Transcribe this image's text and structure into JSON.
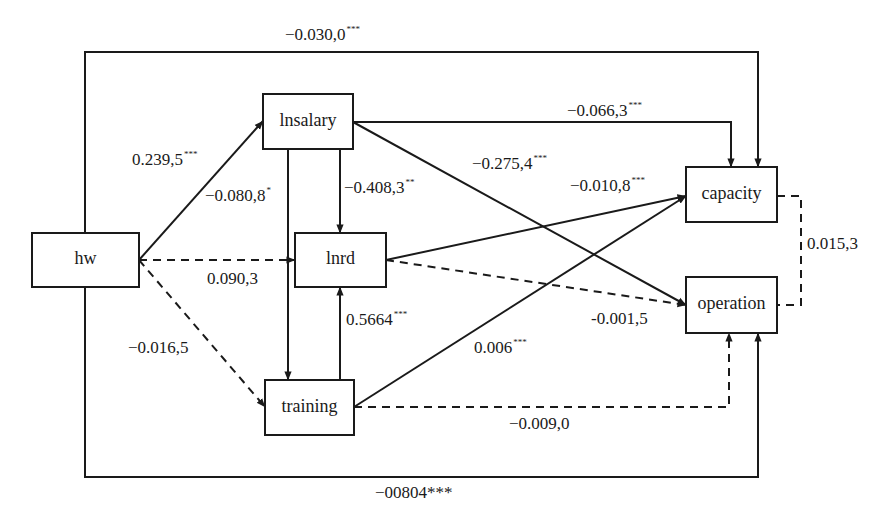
{
  "figure": {
    "type": "path-diagram",
    "nodes": [
      {
        "id": "hw",
        "label": "hw"
      },
      {
        "id": "lnsalary",
        "label": "lnsalary"
      },
      {
        "id": "lnrd",
        "label": "lnrd"
      },
      {
        "id": "training",
        "label": "training"
      },
      {
        "id": "capacity",
        "label": "capacity"
      },
      {
        "id": "operation",
        "label": "operation"
      }
    ],
    "edges": [
      {
        "id": "hw-capacity",
        "from": "hw",
        "to": "capacity",
        "style": "solid",
        "coef": "−0.030,0",
        "sig": "***"
      },
      {
        "id": "hw-lnsalary",
        "from": "hw",
        "to": "lnsalary",
        "style": "solid",
        "coef": "0.239,5",
        "sig": "***"
      },
      {
        "id": "lnsalary-training",
        "from": "lnsalary",
        "to": "training",
        "style": "solid",
        "coef": "−0.080,8",
        "sig": "*"
      },
      {
        "id": "lnsalary-lnrd",
        "from": "lnsalary",
        "to": "lnrd",
        "style": "solid",
        "coef": "−0.408,3",
        "sig": "**"
      },
      {
        "id": "lnsalary-capacity",
        "from": "lnsalary",
        "to": "capacity",
        "style": "solid",
        "coef": "−0.066,3",
        "sig": "***"
      },
      {
        "id": "lnsalary-operation",
        "from": "lnsalary",
        "to": "operation",
        "style": "solid",
        "coef": "−0.275,4",
        "sig": "***"
      },
      {
        "id": "lnrd-capacity",
        "from": "lnrd",
        "to": "capacity",
        "style": "solid",
        "coef": "−0.010,8",
        "sig": "***"
      },
      {
        "id": "hw-lnrd",
        "from": "hw",
        "to": "lnrd",
        "style": "dashed",
        "coef": "0.090,3",
        "sig": ""
      },
      {
        "id": "hw-training",
        "from": "hw",
        "to": "training",
        "style": "dashed",
        "coef": "−0.016,5",
        "sig": ""
      },
      {
        "id": "training-lnrd",
        "from": "training",
        "to": "lnrd",
        "style": "solid",
        "coef": "0.5664",
        "sig": "***"
      },
      {
        "id": "lnrd-operation",
        "from": "lnrd",
        "to": "operation",
        "style": "dashed",
        "coef": "-0.001,5",
        "sig": ""
      },
      {
        "id": "training-capacity",
        "from": "training",
        "to": "capacity",
        "style": "solid",
        "coef": "0.006",
        "sig": "***"
      },
      {
        "id": "training-operation",
        "from": "training",
        "to": "operation",
        "style": "dashed",
        "coef": "−0.009,0",
        "sig": ""
      },
      {
        "id": "capacity-operation",
        "from": "capacity",
        "to": "operation",
        "style": "dashed",
        "coef": "0.015,3",
        "sig": ""
      },
      {
        "id": "hw-operation",
        "from": "hw",
        "to": "operation",
        "style": "solid",
        "coef": "−00804***",
        "sig": ""
      }
    ]
  }
}
